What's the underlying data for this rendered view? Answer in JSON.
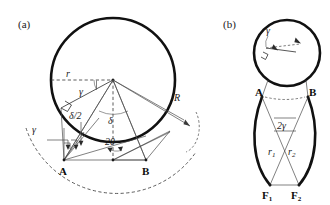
{
  "figure": {
    "width": 330,
    "height": 205,
    "background": "#ffffff",
    "stroke_thick": "#111111",
    "stroke_thin": "#4a4a4a",
    "stroke_dashed": "#333333"
  },
  "panel_a": {
    "label": "(a)",
    "labels": {
      "r": "r",
      "gamma_top": "γ",
      "gamma_left": "γ",
      "delta_half": "δ/2",
      "delta": "δ",
      "two_theta": "2θ",
      "R": "R",
      "A": "A",
      "B": "B"
    }
  },
  "panel_b": {
    "label": "(b)",
    "labels": {
      "gamma": "γ",
      "A": "A",
      "B": "B",
      "two_gamma": "2γ",
      "r1": "r",
      "r1_sub": "1",
      "r2": "r",
      "r2_sub": "2",
      "F1": "F",
      "F1_sub": "1",
      "F2": "F",
      "F2_sub": "2"
    }
  }
}
